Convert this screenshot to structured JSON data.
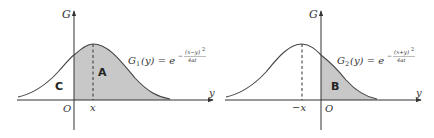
{
  "colors": {
    "axis": "#333333",
    "curve": "#444444",
    "shade": "#c8c8c8",
    "text": "#333333"
  },
  "panels": [
    {
      "id": "left",
      "axis_labels": {
        "vertical": "G",
        "horizontal": "y",
        "origin": "O"
      },
      "marker_label": "x",
      "formula": {
        "lhs": "G",
        "sub": "1",
        "arg": "(y) = e",
        "exp_sign": "−",
        "exp_num": "(x−y)",
        "exp_pow": "2",
        "exp_den": "4αt"
      },
      "regions": [
        {
          "label": "C"
        },
        {
          "label": "A"
        }
      ]
    },
    {
      "id": "right",
      "axis_labels": {
        "vertical": "G",
        "horizontal": "y",
        "origin": "O"
      },
      "marker_label": "−x",
      "formula": {
        "lhs": "G",
        "sub": "2",
        "arg": "(y) = e",
        "exp_sign": "−",
        "exp_num": "(x+y)",
        "exp_pow": "2",
        "exp_den": "4αt"
      },
      "regions": [
        {
          "label": "B"
        }
      ]
    }
  ]
}
